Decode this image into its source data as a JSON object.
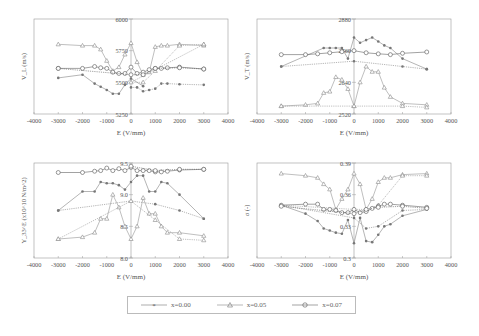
{
  "chart_data": [
    {
      "type": "line",
      "panel": "top-left",
      "ylabel": "V_L (m/s)",
      "xlabel": "E (V/mm)",
      "xlim": [
        -4000,
        4000
      ],
      "ylim": [
        5250,
        6000
      ],
      "xticks": [
        "-4000",
        "-3000",
        "-2000",
        "-1000",
        "0",
        "1000",
        "2000",
        "3000",
        "4000"
      ],
      "yticks": [
        "5250",
        "5500",
        "5750",
        "6000"
      ],
      "series": [
        {
          "name": "x=0.00",
          "marker": "star",
          "branches": [
            {
              "x": [
                -3000,
                -2000,
                -1500,
                -1250,
                -1000,
                -750,
                -500,
                -250,
                0,
                500
              ],
              "y": [
                5535,
                5560,
                5490,
                5465,
                5440,
                5410,
                5410,
                5480,
                5530,
                5470
              ]
            },
            {
              "x": [
                0,
                250,
                500,
                750,
                1000,
                1250,
                1500,
                2000,
                3000
              ],
              "y": [
                5460,
                5460,
                5430,
                5440,
                5450,
                5490,
                5490,
                5485,
                5480
              ]
            }
          ]
        },
        {
          "name": "x=0.05",
          "marker": "triangle",
          "branches": [
            {
              "x": [
                -3000,
                -2000,
                -1500,
                -1250,
                -1000,
                -750,
                -500,
                -250,
                0,
                250,
                500,
                750,
                1000,
                1250,
                1500,
                2000,
                3000
              ],
              "y": [
                5800,
                5790,
                5790,
                5760,
                5670,
                5590,
                5620,
                5720,
                5810,
                5660,
                5560,
                5580,
                5780,
                5790,
                5790,
                5800,
                5790
              ]
            },
            {
              "x": [
                3000,
                2000,
                1000,
                500,
                0,
                3000
              ],
              "y": [
                5800,
                5790,
                5590,
                5500,
                5500,
                5800
              ]
            }
          ]
        },
        {
          "name": "x=0.07",
          "marker": "circle",
          "branches": [
            {
              "x": [
                -3000,
                -2000,
                -1500,
                -1250,
                -1000,
                -750,
                -500,
                -250,
                0,
                250,
                500,
                750,
                1000,
                1250,
                1500,
                2000,
                3000
              ],
              "y": [
                5610,
                5610,
                5625,
                5615,
                5610,
                5580,
                5570,
                5570,
                5620,
                5570,
                5580,
                5600,
                5610,
                5610,
                5615,
                5620,
                5605
              ]
            },
            {
              "x": [
                3000,
                2000,
                1000,
                500,
                0,
                -3000
              ],
              "y": [
                5605,
                5615,
                5610,
                5560,
                5560,
                5610
              ]
            }
          ]
        }
      ]
    },
    {
      "type": "line",
      "panel": "top-right",
      "ylabel": "V_T (m/s)",
      "xlabel": "E (V/mm)",
      "xlim": [
        -4000,
        4000
      ],
      "ylim": [
        2520,
        2880
      ],
      "xticks": [
        "-4000",
        "-3000",
        "-2000",
        "-1000",
        "0",
        "1000",
        "2000",
        "3000",
        "4000"
      ],
      "yticks": [
        "2520",
        "2640",
        "2760",
        "2880"
      ],
      "series": [
        {
          "name": "x=0.00",
          "marker": "star",
          "branches": [
            {
              "x": [
                -3000,
                -1250,
                -1000,
                -750,
                -500,
                -250,
                0,
                250,
                500,
                750,
                1000,
                1250,
                1500,
                2000,
                3000
              ],
              "y": [
                2700,
                2770,
                2770,
                2770,
                2770,
                2730,
                2810,
                2790,
                2800,
                2810,
                2795,
                2780,
                2770,
                2730,
                2690
              ]
            },
            {
              "x": [
                3000,
                2000,
                0,
                -3000
              ],
              "y": [
                2690,
                2700,
                2720,
                2700
              ]
            }
          ]
        },
        {
          "name": "x=0.05",
          "marker": "triangle",
          "branches": [
            {
              "x": [
                -3000,
                -2000,
                -1500,
                -1250,
                -1000,
                -750,
                -500,
                -250,
                0,
                250,
                500,
                750,
                1000,
                1250,
                1500,
                2000,
                3000
              ],
              "y": [
                2550,
                2555,
                2560,
                2600,
                2605,
                2660,
                2650,
                2615,
                2550,
                2640,
                2700,
                2680,
                2680,
                2620,
                2585,
                2560,
                2555
              ]
            },
            {
              "x": [
                3000,
                2000,
                0,
                -3000
              ],
              "y": [
                2545,
                2550,
                2550,
                2550
              ]
            }
          ]
        },
        {
          "name": "x=0.07",
          "marker": "circle",
          "branches": [
            {
              "x": [
                -3000,
                -2000,
                -1500,
                -1000,
                -500,
                0,
                500,
                1000,
                1500,
                2000,
                3000
              ],
              "y": [
                2745,
                2745,
                2748,
                2752,
                2756,
                2760,
                2752,
                2748,
                2745,
                2750,
                2755
              ]
            }
          ]
        }
      ]
    },
    {
      "type": "line",
      "panel": "bottom-left",
      "ylabel": "Y_33^E (x10^10 N/m^2)",
      "xlabel": "E (V/mm)",
      "xlim": [
        -4000,
        4000
      ],
      "ylim": [
        8.0,
        9.5
      ],
      "xticks": [
        "-4000",
        "-3000",
        "-2000",
        "-1000",
        "0",
        "1000",
        "2000",
        "3000",
        "4000"
      ],
      "yticks": [
        "8.0",
        "8.5",
        "9.0",
        "9.5"
      ],
      "series": [
        {
          "name": "x=0.00",
          "marker": "star",
          "branches": [
            {
              "x": [
                -3000,
                -2000,
                -1500,
                -1250,
                -1000,
                -750,
                -500,
                -250,
                0,
                250,
                500,
                750,
                1000,
                1250,
                1500,
                2000,
                3000
              ],
              "y": [
                8.75,
                9.05,
                9.05,
                9.2,
                9.18,
                9.18,
                9.15,
                9.08,
                9.2,
                9.3,
                9.3,
                9.05,
                9.05,
                9.2,
                9.18,
                9.0,
                8.62
              ]
            },
            {
              "x": [
                3000,
                2000,
                1000,
                0,
                -3000
              ],
              "y": [
                8.62,
                8.75,
                8.85,
                8.9,
                8.75
              ]
            }
          ]
        },
        {
          "name": "x=0.05",
          "marker": "triangle",
          "branches": [
            {
              "x": [
                -3000,
                -2000,
                -1500,
                -1250,
                -1000,
                -750,
                -500,
                -250,
                0,
                250,
                500,
                750,
                1000,
                1250,
                1500,
                2000,
                3000
              ],
              "y": [
                8.3,
                8.33,
                8.4,
                8.62,
                8.62,
                9.0,
                8.8,
                8.5,
                8.3,
                8.5,
                8.95,
                8.7,
                8.7,
                8.5,
                8.4,
                8.4,
                8.35
              ]
            },
            {
              "x": [
                3000,
                2000,
                1000,
                0,
                -3000
              ],
              "y": [
                8.28,
                8.3,
                8.6,
                8.9,
                8.3
              ]
            }
          ]
        },
        {
          "name": "x=0.07",
          "marker": "circle",
          "branches": [
            {
              "x": [
                -3000,
                -2000,
                -1500,
                -1250,
                -1000,
                -750,
                -500,
                -250,
                0,
                250,
                500,
                750,
                1000,
                1250,
                1500,
                2000,
                3000
              ],
              "y": [
                9.35,
                9.35,
                9.37,
                9.38,
                9.42,
                9.38,
                9.41,
                9.38,
                9.43,
                9.38,
                9.38,
                9.38,
                9.36,
                9.36,
                9.37,
                9.39,
                9.4
              ]
            },
            {
              "x": [
                3000,
                2000,
                1000,
                0
              ],
              "y": [
                9.4,
                9.4,
                9.38,
                9.45
              ]
            }
          ]
        }
      ]
    },
    {
      "type": "line",
      "panel": "bottom-right",
      "ylabel": "σ (-)",
      "xlabel": "E (V/mm)",
      "xlim": [
        -4000,
        4000
      ],
      "ylim": [
        0.3,
        0.39
      ],
      "xticks": [
        "-4000",
        "-3000",
        "-2000",
        "-1000",
        "0",
        "1000",
        "2000",
        "3000",
        "4000"
      ],
      "yticks": [
        "0.3",
        "0.33",
        "0.36",
        "0.39"
      ],
      "series": [
        {
          "name": "x=0.00",
          "marker": "star",
          "branches": [
            {
              "x": [
                -3000,
                -2000,
                -1500,
                -1250,
                -1000,
                -750,
                -500,
                -250,
                0,
                250,
                500,
                750,
                1000,
                1250,
                1500,
                2000,
                3000
              ],
              "y": [
                0.35,
                0.342,
                0.335,
                0.328,
                0.326,
                0.324,
                0.323,
                0.336,
                0.314,
                0.338,
                0.316,
                0.315,
                0.322,
                0.33,
                0.332,
                0.34,
                0.346
              ]
            },
            {
              "x": [
                3000,
                2000,
                1000,
                500,
                0,
                -3000
              ],
              "y": [
                0.346,
                0.345,
                0.33,
                0.328,
                0.338,
                0.35
              ]
            }
          ]
        },
        {
          "name": "x=0.05",
          "marker": "triangle",
          "branches": [
            {
              "x": [
                -3000,
                -2000,
                -1500,
                -1250,
                -1000,
                -750,
                -500,
                -250,
                0,
                250,
                500,
                750,
                1000,
                1250,
                1500,
                2000,
                3000
              ],
              "y": [
                0.38,
                0.378,
                0.376,
                0.37,
                0.365,
                0.346,
                0.356,
                0.365,
                0.38,
                0.37,
                0.346,
                0.356,
                0.372,
                0.376,
                0.376,
                0.379,
                0.38
              ]
            },
            {
              "x": [
                3000,
                2000,
                1000,
                500,
                0,
                -3000
              ],
              "y": [
                0.378,
                0.378,
                0.35,
                0.346,
                0.346,
                0.35
              ]
            }
          ]
        },
        {
          "name": "x=0.07",
          "marker": "circle",
          "branches": [
            {
              "x": [
                -3000,
                -2000,
                -1500,
                -1250,
                -1000,
                -750,
                -500,
                -250,
                0,
                250,
                500,
                750,
                1000,
                1250,
                1500,
                2000,
                3000
              ],
              "y": [
                0.35,
                0.351,
                0.351,
                0.346,
                0.346,
                0.345,
                0.343,
                0.343,
                0.346,
                0.343,
                0.344,
                0.347,
                0.349,
                0.351,
                0.351,
                0.35,
                0.348
              ]
            },
            {
              "x": [
                3000,
                2000,
                1000,
                500,
                0,
                -3000
              ],
              "y": [
                0.347,
                0.349,
                0.348,
                0.346,
                0.342,
                0.349
              ]
            }
          ]
        }
      ]
    }
  ],
  "panels": [
    {
      "id": "p1",
      "left": 34,
      "top": 19
    },
    {
      "id": "p2",
      "left": 257,
      "top": 19
    },
    {
      "id": "p3",
      "left": 34,
      "top": 163
    },
    {
      "id": "p4",
      "left": 257,
      "top": 163
    }
  ],
  "legend": {
    "items": [
      {
        "label": "x=0.00",
        "marker": "star"
      },
      {
        "label": "x=0.05",
        "marker": "triangle"
      },
      {
        "label": "x=0.07",
        "marker": "circle"
      }
    ]
  },
  "colors": {
    "axis": "#999999",
    "x000": "#777777",
    "x005": "#8a8a8a",
    "x007": "#555555",
    "text": "#555555"
  }
}
